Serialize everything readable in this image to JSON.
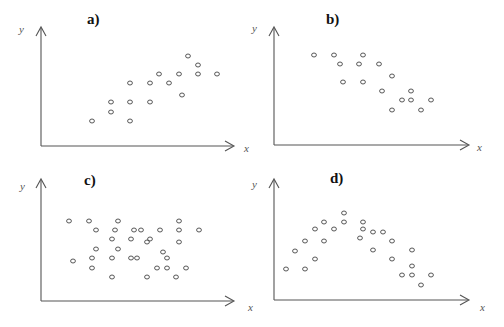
{
  "chart_data": [
    {
      "type": "scatter",
      "title": "a)",
      "xlabel": "x",
      "ylabel": "y",
      "grid": false,
      "relationship": "positive linear",
      "points_px": [
        [
          92,
          121
        ],
        [
          111,
          102
        ],
        [
          111,
          112
        ],
        [
          130,
          83
        ],
        [
          130,
          102
        ],
        [
          130,
          121
        ],
        [
          150,
          83
        ],
        [
          150,
          102
        ],
        [
          159,
          74
        ],
        [
          169,
          83
        ],
        [
          179,
          74
        ],
        [
          182,
          95
        ],
        [
          188,
          56
        ],
        [
          198,
          65
        ],
        [
          198,
          74
        ],
        [
          217,
          74
        ]
      ]
    },
    {
      "type": "scatter",
      "title": "b)",
      "xlabel": "x",
      "ylabel": "y",
      "grid": false,
      "relationship": "negative linear",
      "points_px": [
        [
          314,
          55
        ],
        [
          334,
          55
        ],
        [
          340,
          64
        ],
        [
          359,
          64
        ],
        [
          363,
          55
        ],
        [
          379,
          64
        ],
        [
          392,
          76
        ],
        [
          343,
          82
        ],
        [
          363,
          82
        ],
        [
          382,
          91
        ],
        [
          411,
          91
        ],
        [
          402,
          100
        ],
        [
          411,
          100
        ],
        [
          431,
          100
        ],
        [
          392,
          110
        ],
        [
          421,
          110
        ]
      ]
    },
    {
      "type": "scatter",
      "title": "c)",
      "xlabel": "x",
      "ylabel": "y",
      "grid": false,
      "relationship": "no correlation",
      "points_px": [
        [
          69,
          221
        ],
        [
          89,
          221
        ],
        [
          118,
          221
        ],
        [
          179,
          221
        ],
        [
          96,
          230
        ],
        [
          115,
          230
        ],
        [
          134,
          230
        ],
        [
          141,
          230
        ],
        [
          160,
          230
        ],
        [
          179,
          230
        ],
        [
          199,
          230
        ],
        [
          112,
          239
        ],
        [
          131,
          239
        ],
        [
          147,
          242
        ],
        [
          150,
          239
        ],
        [
          179,
          242
        ],
        [
          96,
          249
        ],
        [
          118,
          249
        ],
        [
          163,
          252
        ],
        [
          73,
          261
        ],
        [
          92,
          258
        ],
        [
          112,
          258
        ],
        [
          131,
          258
        ],
        [
          137,
          258
        ],
        [
          167,
          258
        ],
        [
          92,
          268
        ],
        [
          157,
          268
        ],
        [
          167,
          268
        ],
        [
          186,
          268
        ],
        [
          112,
          277
        ],
        [
          147,
          277
        ],
        [
          176,
          277
        ]
      ]
    },
    {
      "type": "scatter",
      "title": "d)",
      "xlabel": "x",
      "ylabel": "y",
      "grid": false,
      "relationship": "non-linear (inverted U)",
      "points_px": [
        [
          344,
          213
        ],
        [
          324,
          222
        ],
        [
          344,
          222
        ],
        [
          363,
          222
        ],
        [
          315,
          229
        ],
        [
          334,
          229
        ],
        [
          363,
          229
        ],
        [
          373,
          232
        ],
        [
          383,
          232
        ],
        [
          305,
          241
        ],
        [
          324,
          241
        ],
        [
          360,
          238
        ],
        [
          392,
          241
        ],
        [
          295,
          251
        ],
        [
          373,
          250
        ],
        [
          412,
          250
        ],
        [
          315,
          259
        ],
        [
          392,
          259
        ],
        [
          286,
          269
        ],
        [
          305,
          269
        ],
        [
          412,
          266
        ],
        [
          402,
          275
        ],
        [
          412,
          275
        ],
        [
          431,
          275
        ],
        [
          421,
          285
        ]
      ]
    }
  ],
  "panels": [
    {
      "label": "a)",
      "x_axis_label": "x",
      "y_axis_label": "y"
    },
    {
      "label": "b)",
      "x_axis_label": "x",
      "y_axis_label": "y"
    },
    {
      "label": "c)",
      "x_axis_label": "x",
      "y_axis_label": "y"
    },
    {
      "label": "d)",
      "x_axis_label": "x",
      "y_axis_label": "y"
    }
  ]
}
